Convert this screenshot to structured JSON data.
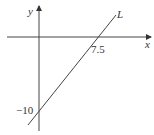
{
  "diagram": {
    "axes": {
      "x_label": "x",
      "y_label": "y"
    },
    "line": {
      "label": "L",
      "x_intercept": "7.5",
      "y_intercept": "−10"
    }
  }
}
